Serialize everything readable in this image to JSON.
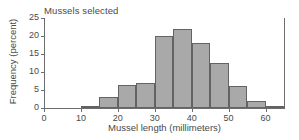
{
  "chart_data": {
    "type": "bar",
    "title": "Mussels selected",
    "xlabel": "Mussel length (millimeters)",
    "ylabel": "Frequency (percent)",
    "grid": false,
    "legend": false,
    "xlim": [
      0,
      65
    ],
    "ylim": [
      0,
      25
    ],
    "bin_width": 5,
    "xticks": [
      0,
      10,
      20,
      30,
      40,
      50,
      60
    ],
    "xtick_labels": [
      "0",
      "10",
      "20",
      "30",
      "40",
      "50",
      "60"
    ],
    "yticks": [
      0,
      5,
      10,
      15,
      20,
      25
    ],
    "ytick_labels": [
      "0",
      "5",
      "10",
      "15",
      "20",
      "25"
    ],
    "bar_color": "#a9a9a9",
    "bar_edge_color": "#636363",
    "axis_color": "#6d6d6d",
    "categories": [
      "10-15",
      "15-20",
      "20-25",
      "25-30",
      "30-35",
      "35-40",
      "40-45",
      "45-50",
      "50-55",
      "55-60",
      "60-65"
    ],
    "bin_starts": [
      10,
      15,
      20,
      25,
      30,
      35,
      40,
      45,
      50,
      55,
      60
    ],
    "values": [
      0.5,
      3,
      6.5,
      7,
      20,
      22,
      18,
      12.5,
      6,
      2,
      0.5
    ]
  }
}
